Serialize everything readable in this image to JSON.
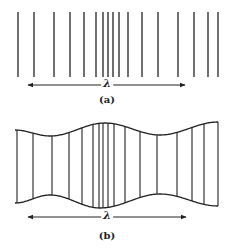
{
  "figure": {
    "panel_a": {
      "label": "(a)",
      "wavelength_symbol": "λ",
      "line_x": [
        18,
        34,
        54,
        70,
        84,
        96,
        103,
        108,
        113,
        119,
        128,
        142,
        158,
        178,
        194,
        208,
        218
      ],
      "line_top": 12,
      "line_bottom": 77,
      "arrow": {
        "y": 85,
        "x1": 28,
        "x2": 185
      }
    },
    "panel_b": {
      "label": "(b)",
      "wavelength_symbol": "λ",
      "line_x": [
        17,
        33,
        52,
        69,
        82,
        93,
        99,
        103,
        108,
        114,
        125,
        140,
        157,
        177,
        192,
        204,
        218
      ],
      "top_boundary": [
        [
          15,
          130
        ],
        [
          50,
          136
        ],
        [
          105,
          123
        ],
        [
          160,
          135
        ],
        [
          218,
          122
        ]
      ],
      "bottom_boundary": [
        [
          15,
          203
        ],
        [
          50,
          195
        ],
        [
          100,
          208
        ],
        [
          160,
          194
        ],
        [
          218,
          206
        ]
      ],
      "arrow": {
        "y": 217,
        "x1": 28,
        "x2": 186
      }
    },
    "stroke_color": "#222222"
  }
}
